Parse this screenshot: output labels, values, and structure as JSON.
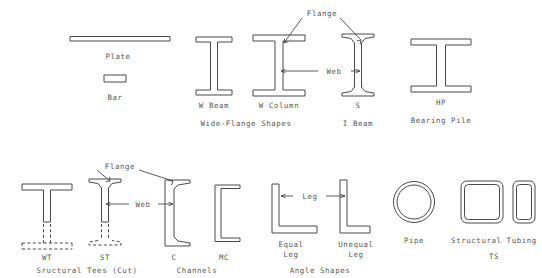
{
  "diagram": {
    "background_color": "#ffffff",
    "line_color": "#4a4a4a",
    "text_color": "#5a5a5a"
  },
  "annotations": {
    "flange_top": "Flange",
    "web_top": "Web",
    "flange_bottom": "Flange",
    "web_bottom": "Web",
    "leg": "Leg"
  },
  "shapes": {
    "plate": {
      "label": "Plate",
      "name": "plate"
    },
    "bar": {
      "label": "Bar",
      "name": "bar"
    },
    "w_beam": {
      "label": "W Beam",
      "name": "w-beam"
    },
    "w_column": {
      "label": "W Column",
      "name": "w-column"
    },
    "s_shape": {
      "label": "S",
      "name": "s-shape"
    },
    "hp": {
      "label": "HP",
      "name": "hp-shape"
    },
    "wt": {
      "label": "WT",
      "name": "wt-tee"
    },
    "st": {
      "label": "ST",
      "name": "st-tee"
    },
    "c_channel": {
      "label": "C",
      "name": "c-channel"
    },
    "mc_channel": {
      "label": "MC",
      "name": "mc-channel"
    },
    "equal_leg": {
      "label": "Equal\nLeg",
      "line1": "Equal",
      "line2": "Leg",
      "name": "equal-leg-angle"
    },
    "unequal_leg": {
      "label": "Unequal\nLeg",
      "line1": "Unequal",
      "line2": "Leg",
      "name": "unequal-leg-angle"
    },
    "pipe": {
      "label": "Pipe",
      "name": "pipe"
    },
    "tube_square": {
      "label": "",
      "name": "square-tube"
    },
    "tube_rect": {
      "label": "",
      "name": "rectangular-tube"
    }
  },
  "groups": {
    "wide_flange": "Wide-Flange Shapes",
    "i_beam": "I Beam",
    "bearing_pile": "Bearing Pile",
    "structural_tees": "Sructural Tees (Cut)",
    "channels": "Channels",
    "angle_shapes": "Angle Shapes",
    "structural_tubing": "Structural Tubing",
    "ts": "TS"
  }
}
